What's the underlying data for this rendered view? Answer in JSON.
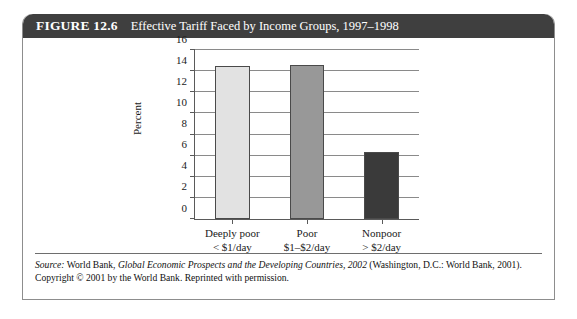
{
  "figure": {
    "number_label": "FIGURE 12.6",
    "title": "Effective Tariff Faced by Income Groups, 1997–1998"
  },
  "source": {
    "label": "Source:",
    "text_1": " World Bank, ",
    "italic_work": "Global Economic Prospects and the Developing Countries, 2002",
    "text_2": " (Washington, D.C.: World Bank, 2001). Copyright © 2001 by the World Bank. Reprinted with permission."
  },
  "chart_data": {
    "type": "bar",
    "title": "Effective Tariff Faced by Income Groups, 1997–1998",
    "xlabel": "",
    "ylabel": "Percent",
    "ylim": [
      0,
      16
    ],
    "ytick_step": 2,
    "yticks": [
      "0",
      "2",
      "4",
      "6",
      "8",
      "10",
      "12",
      "14",
      "16"
    ],
    "grid": true,
    "legend": "none",
    "categories": [
      "Deeply poor",
      "Poor",
      "Nonpoor"
    ],
    "category_sublabels": [
      "< $1/day",
      "$1–$2/day",
      "> $2/day"
    ],
    "values": [
      14.5,
      14.6,
      6.3
    ],
    "bar_colors": [
      "#e2e2e2",
      "#989898",
      "#3a3a3a"
    ],
    "bar_edge_color": "#4a4a4a"
  }
}
